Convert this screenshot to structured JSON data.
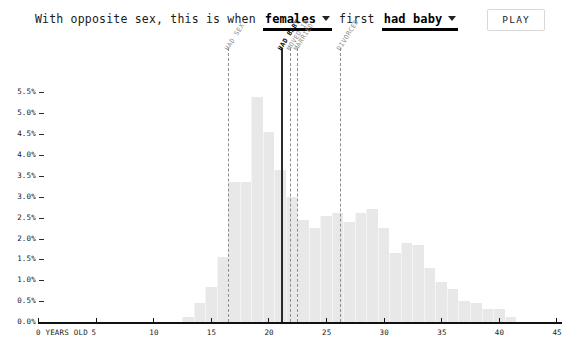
{
  "header": {
    "prefix": "With opposite sex, this is when",
    "subject_dropdown": {
      "label": "females",
      "icon": "chevron-down-icon"
    },
    "middle": "first",
    "event_dropdown": {
      "label": "had baby",
      "icon": "chevron-down-icon"
    },
    "play_label": "PLAY"
  },
  "chart_data": {
    "type": "bar",
    "title": "",
    "subtitle": "",
    "xlabel": "0 YEARS OLD",
    "ylabel": "",
    "xlim": [
      0,
      45
    ],
    "ylim": [
      0,
      5.75
    ],
    "grid": false,
    "legend": "none",
    "x_tick_labels": [
      "0 YEARS OLD",
      "5",
      "10",
      "15",
      "20",
      "25",
      "30",
      "35",
      "40",
      "45"
    ],
    "x_ticks": [
      0,
      5,
      10,
      15,
      20,
      25,
      30,
      35,
      40,
      45
    ],
    "y_tick_labels": [
      "0.0%",
      "0.5%",
      "1.0%",
      "1.5%",
      "2.0%",
      "2.5%",
      "3.0%",
      "3.5%",
      "4.0%",
      "4.5%",
      "5.0%",
      "5.5%"
    ],
    "y_ticks": [
      0.0,
      0.5,
      1.0,
      1.5,
      2.0,
      2.5,
      3.0,
      3.5,
      4.0,
      4.5,
      5.0,
      5.5
    ],
    "categories": [
      13,
      14,
      15,
      16,
      17,
      18,
      19,
      20,
      21,
      22,
      23,
      24,
      25,
      26,
      27,
      28,
      29,
      30,
      31,
      32,
      33,
      34,
      35,
      36,
      37,
      38,
      39,
      40,
      41
    ],
    "values": [
      0.12,
      0.45,
      0.85,
      1.55,
      3.35,
      3.35,
      5.4,
      4.55,
      3.65,
      3.0,
      2.45,
      2.25,
      2.55,
      2.6,
      2.4,
      2.6,
      2.7,
      2.25,
      1.65,
      1.9,
      1.85,
      1.3,
      0.95,
      0.8,
      0.5,
      0.45,
      0.3,
      0.3,
      0.12
    ],
    "annotations": [
      {
        "label": "HAD SEX",
        "x": 16.5,
        "style": "dashed",
        "bold": false
      },
      {
        "label": "HAD BABY",
        "x": 21.1,
        "style": "solid",
        "bold": true
      },
      {
        "label": "MOVED IN",
        "x": 21.9,
        "style": "dashed",
        "bold": false
      },
      {
        "label": "MARRIED",
        "x": 22.5,
        "style": "dashed",
        "bold": false
      },
      {
        "label": "DIVORCED",
        "x": 26.2,
        "style": "dashed",
        "bold": false
      }
    ]
  },
  "colors": {
    "bar": "#e8e8e8",
    "axis": "#111111",
    "annotation_dashed": "#8d8d8d",
    "annotation_solid": "#2a2a2a",
    "accent": "#000000"
  }
}
